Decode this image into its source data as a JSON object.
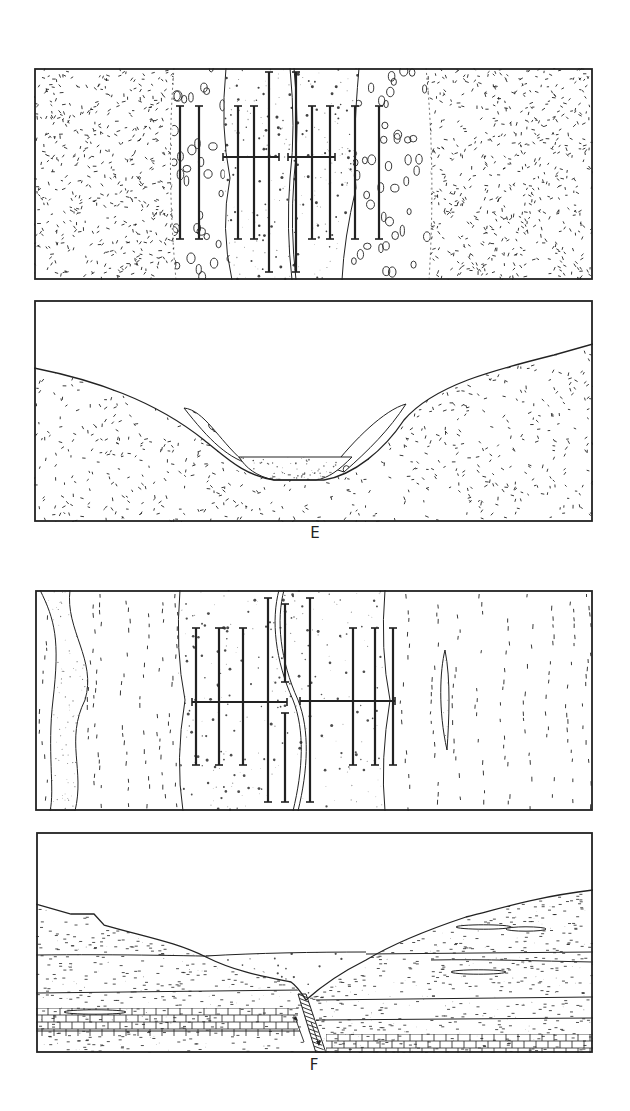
{
  "figure": {
    "panels": [
      {
        "id": "E-map",
        "kind": "map-view",
        "caption": ""
      },
      {
        "id": "E-section",
        "kind": "cross-section",
        "caption": "E"
      },
      {
        "id": "F-map",
        "kind": "map-view",
        "caption": ""
      },
      {
        "id": "F-section",
        "kind": "cross-section",
        "caption": "F"
      }
    ],
    "captions": {
      "E": "E",
      "F": "F"
    },
    "colors": {
      "ink": "#222222",
      "background": "#ffffff"
    }
  }
}
